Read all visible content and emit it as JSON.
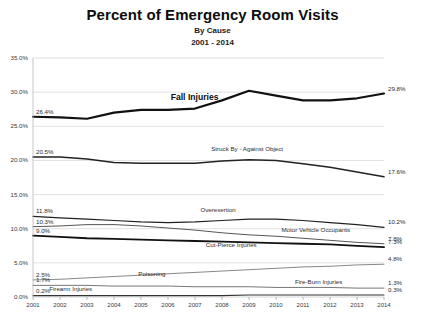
{
  "chart_data": {
    "type": "line",
    "title": "Percent of Emergency Room Visits",
    "subtitle": "By Cause",
    "subtitle2": "2001 - 2014",
    "xlabel": "",
    "ylabel": "",
    "ylim": [
      0,
      35
    ],
    "ytick_step": 5,
    "grid": true,
    "legend_position": "inline-annotations",
    "categories": [
      "2001",
      "2002",
      "2003",
      "2004",
      "2005",
      "2006",
      "2007",
      "2008",
      "2009",
      "2010",
      "2011",
      "2012",
      "2013",
      "2014"
    ],
    "yticks": [
      "0.0%",
      "5.0%",
      "10.0%",
      "15.0%",
      "20.0%",
      "25.0%",
      "30.0%",
      "35.0%"
    ],
    "series": [
      {
        "name": "Fall Injuries",
        "label": "Fall Injuries",
        "start_label": "26.4%",
        "end_label": "29.8%",
        "color": "#111111",
        "width": 2.2,
        "values": [
          26.4,
          26.3,
          26.1,
          27.0,
          27.4,
          27.4,
          27.6,
          28.8,
          30.2,
          29.5,
          28.8,
          28.8,
          29.1,
          29.8
        ]
      },
      {
        "name": "Struck By - Against Object",
        "label": "Struck By - Against Object",
        "start_label": "20.5%",
        "end_label": "17.6%",
        "color": "#222222",
        "width": 1.5,
        "values": [
          20.5,
          20.5,
          20.2,
          19.7,
          19.6,
          19.6,
          19.6,
          19.9,
          20.1,
          20.0,
          19.5,
          19.0,
          18.3,
          17.6
        ]
      },
      {
        "name": "Overexertion",
        "label": "Overexertion",
        "start_label": "11.8%",
        "end_label": "10.2%",
        "color": "#222222",
        "width": 1.2,
        "values": [
          11.8,
          11.6,
          11.4,
          11.2,
          11.0,
          10.9,
          11.0,
          11.2,
          11.4,
          11.4,
          11.2,
          10.9,
          10.6,
          10.2
        ]
      },
      {
        "name": "Motor Vehicle Occupants",
        "label": "Motor Vehicle Occupants",
        "start_label": "10.3%",
        "end_label": "7.8%",
        "color": "#555555",
        "width": 1.0,
        "values": [
          10.3,
          10.4,
          10.6,
          10.6,
          10.4,
          10.1,
          9.8,
          9.4,
          9.1,
          8.9,
          8.6,
          8.3,
          8.0,
          7.8
        ]
      },
      {
        "name": "Cut-Pierce Injuries",
        "label": "Cut-Pierce Injuries",
        "start_label": "9.0%",
        "end_label": "7.3%",
        "color": "#111111",
        "width": 1.8,
        "values": [
          9.0,
          8.8,
          8.6,
          8.5,
          8.4,
          8.3,
          8.2,
          8.1,
          8.0,
          7.9,
          7.8,
          7.7,
          7.5,
          7.3
        ]
      },
      {
        "name": "Poisoning",
        "label": "Poisoning",
        "start_label": "2.5%",
        "end_label": "4.8%",
        "color": "#888888",
        "width": 1.0,
        "values": [
          2.5,
          2.6,
          2.8,
          3.0,
          3.2,
          3.4,
          3.6,
          3.8,
          4.0,
          4.2,
          4.4,
          4.5,
          4.7,
          4.8
        ]
      },
      {
        "name": "Fire-Burn Injuries",
        "label": "Fire-Burn Injuries",
        "start_label": "1.7%",
        "end_label": "1.3%",
        "color": "#777777",
        "width": 1.0,
        "values": [
          1.7,
          1.7,
          1.7,
          1.6,
          1.6,
          1.6,
          1.5,
          1.5,
          1.5,
          1.4,
          1.4,
          1.4,
          1.3,
          1.3
        ]
      },
      {
        "name": "Firearm Injuries",
        "label": "Firearm Injuries",
        "start_label": "0.2%",
        "end_label": "0.3%",
        "color": "#333333",
        "width": 1.1,
        "values": [
          0.2,
          0.2,
          0.2,
          0.2,
          0.2,
          0.2,
          0.2,
          0.2,
          0.3,
          0.3,
          0.3,
          0.3,
          0.3,
          0.3
        ]
      }
    ],
    "annotations": [
      {
        "text": "Fall Injuries",
        "x": 5.1,
        "y": 29.2,
        "style": "big"
      },
      {
        "text": "Struck By - Against Object",
        "x": 6.6,
        "y": 21.4,
        "style": "small"
      },
      {
        "text": "Overexertion",
        "x": 6.2,
        "y": 12.5,
        "style": "small"
      },
      {
        "text": "Motor Vehicle Occupants",
        "x": 9.2,
        "y": 9.5,
        "style": "small"
      },
      {
        "text": "Cut-Pierce Injuries",
        "x": 6.4,
        "y": 7.3,
        "style": "small"
      },
      {
        "text": "Poisoning",
        "x": 3.9,
        "y": 3.1,
        "style": "small"
      },
      {
        "text": "Fire-Burn Injuries",
        "x": 9.7,
        "y": 1.9,
        "style": "small"
      },
      {
        "text": "Firearm Injuries",
        "x": 0.6,
        "y": 0.95,
        "style": "small"
      }
    ]
  }
}
